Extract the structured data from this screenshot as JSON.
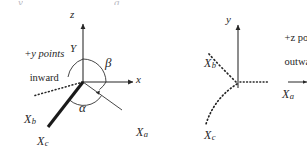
{
  "figure": {
    "background_color": "#ffffff",
    "ink_color": "#262626",
    "width": 307,
    "height": 147,
    "clipped_top_fragments": [
      "y",
      "a"
    ]
  },
  "left_diagram": {
    "name": "three-axis-perspective-frame",
    "note": {
      "line1": "+y points",
      "line2": "inward"
    },
    "axes": [
      {
        "id": "z",
        "label": "z",
        "direction": "up",
        "arrow": true
      },
      {
        "id": "x",
        "label": "x",
        "direction": "right",
        "arrow": true
      },
      {
        "id": "Y",
        "label": "Y",
        "direction": "up",
        "arrow": false
      }
    ],
    "vectors": [
      {
        "id": "Xb",
        "label": "X",
        "subscript": "b",
        "style": "dotted",
        "weight": "thin"
      },
      {
        "id": "Xc",
        "label": "X",
        "subscript": "c",
        "style": "solid",
        "weight": "bold"
      },
      {
        "id": "Xa",
        "label": "X",
        "subscript": "a",
        "style": "solid",
        "weight": "thin"
      }
    ],
    "angles": [
      {
        "id": "beta",
        "label": "β",
        "between": [
          "z",
          "x"
        ]
      },
      {
        "id": "alpha",
        "label": "α",
        "between": [
          "Xc",
          "Xa"
        ]
      }
    ]
  },
  "right_diagram": {
    "name": "two-axis-projection-frame",
    "note": {
      "line1": "+z poi",
      "line2": "outwa",
      "clipped": true
    },
    "axes": [
      {
        "id": "y",
        "label": "y",
        "direction": "up",
        "arrow": true
      }
    ],
    "vectors": [
      {
        "id": "Xb",
        "label": "X",
        "subscript": "b",
        "style": "dotted"
      },
      {
        "id": "Xc",
        "label": "X",
        "subscript": "c",
        "style": "dotted"
      },
      {
        "id": "Xa",
        "label": "X",
        "subscript": "a",
        "style": "dotted-then-solid-arrow"
      }
    ]
  }
}
